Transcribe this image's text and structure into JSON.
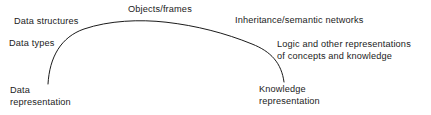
{
  "figure": {
    "background_color": "#ffffff",
    "ink_color": "#1b1b1b"
  },
  "arc": {
    "name": "continuum-arc",
    "description": "Single thin arc spanning from the data representation end on the left to the knowledge representation end on the right",
    "stroke_color": "#1b1b1b",
    "stroke_width": 1,
    "left_endpoint": [
      48,
      84
    ],
    "apex": [
      166,
      22
    ],
    "right_endpoint": [
      284,
      82
    ]
  },
  "labels": {
    "objects_frames": "Objects/frames",
    "data_structures": "Data structures",
    "inheritance_semantic_networks": "Inheritance/semantic networks",
    "data_types": "Data types",
    "logic_and_other": "Logic and other representations\nof concepts and knowledge",
    "data_representation": "Data\nrepresentation",
    "knowledge_representation": "Knowledge\nrepresentation"
  }
}
